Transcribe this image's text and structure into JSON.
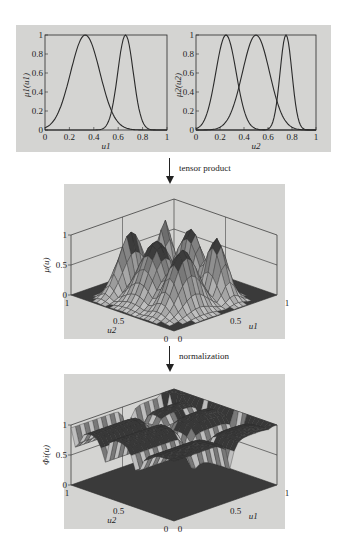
{
  "figure": {
    "top_panel": {
      "left_plot": {
        "ylabel": "μ1(u1)",
        "xlabel": "u1",
        "xticks": [
          "0",
          "0.2",
          "0.4",
          "0.6",
          "0.8",
          "1"
        ],
        "yticks": [
          "0",
          "0.2",
          "0.4",
          "0.6",
          "0.8",
          "1"
        ]
      },
      "right_plot": {
        "ylabel": "μ2(u2)",
        "xlabel": "u2",
        "xticks": [
          "0",
          "0.2",
          "0.4",
          "0.6",
          "0.8",
          "1"
        ],
        "yticks": [
          "0",
          "0.2",
          "0.4",
          "0.6",
          "0.8",
          "1"
        ]
      }
    },
    "step1": {
      "label": "tensor product",
      "icon": "down-arrow-icon"
    },
    "middle_panel": {
      "zlabel": "μ(u)",
      "zticks": [
        "0",
        "0.5",
        "1"
      ],
      "u2_label": "u2",
      "u1_label": "u1",
      "u2_ticks": [
        "1",
        "0.5",
        "0"
      ],
      "u1_ticks": [
        "0",
        "0.5",
        "1"
      ]
    },
    "step2": {
      "label": "normalization",
      "icon": "down-arrow-icon"
    },
    "bottom_panel": {
      "zlabel": "Φi(u)",
      "zticks": [
        "0",
        "0.5",
        "1"
      ],
      "u2_label": "u2",
      "u1_label": "u1",
      "u2_ticks": [
        "1",
        "0.5",
        "0"
      ],
      "u1_ticks": [
        "0",
        "0.5",
        "1"
      ]
    },
    "colors": {
      "panel_bg": "#d4d4d2",
      "line": "#2a2a2a",
      "surface_dark": "#3a3a3a",
      "surface_light": "#b8b8b8"
    }
  },
  "chart_data": [
    {
      "type": "line",
      "title": "",
      "xlabel": "u1",
      "ylabel": "μ1(u1)",
      "xlim": [
        0,
        1
      ],
      "ylim": [
        0,
        1
      ],
      "grid": false,
      "series": [
        {
          "name": "μ1,1",
          "shape": "bell",
          "center": 0.33,
          "x": [
            0,
            0.1,
            0.2,
            0.3,
            0.33,
            0.4,
            0.5,
            0.6,
            0.7,
            0.8,
            0.9
          ],
          "values": [
            0.05,
            0.3,
            0.68,
            0.98,
            1.0,
            0.93,
            0.55,
            0.2,
            0.05,
            0.01,
            0
          ]
        },
        {
          "name": "μ1,2",
          "shape": "bell",
          "center": 0.66,
          "x": [
            0.4,
            0.5,
            0.55,
            0.6,
            0.66,
            0.7,
            0.75,
            0.8,
            0.9
          ],
          "values": [
            0,
            0.1,
            0.35,
            0.75,
            1.0,
            0.85,
            0.45,
            0.15,
            0
          ]
        }
      ]
    },
    {
      "type": "line",
      "title": "",
      "xlabel": "u2",
      "ylabel": "μ2(u2)",
      "xlim": [
        0,
        1
      ],
      "ylim": [
        0,
        1
      ],
      "grid": false,
      "series": [
        {
          "name": "μ2,1",
          "shape": "bell",
          "center": 0.25,
          "x": [
            0,
            0.1,
            0.2,
            0.25,
            0.3,
            0.4,
            0.5,
            0.58
          ],
          "values": [
            0.05,
            0.4,
            0.9,
            1.0,
            0.9,
            0.45,
            0.1,
            0
          ]
        },
        {
          "name": "μ2,2",
          "shape": "bell",
          "center": 0.5,
          "x": [
            0,
            0.1,
            0.2,
            0.3,
            0.4,
            0.5,
            0.6,
            0.7,
            0.8,
            0.9
          ],
          "values": [
            0,
            0.02,
            0.15,
            0.45,
            0.85,
            1.0,
            0.8,
            0.4,
            0.1,
            0
          ]
        },
        {
          "name": "μ2,3",
          "shape": "bell",
          "center": 0.75,
          "x": [
            0.55,
            0.6,
            0.65,
            0.7,
            0.75,
            0.8,
            0.85,
            0.9
          ],
          "values": [
            0,
            0.05,
            0.25,
            0.65,
            1.0,
            0.7,
            0.25,
            0
          ]
        }
      ]
    },
    {
      "type": "surface",
      "title": "tensor product",
      "xlabel": "u1",
      "ylabel": "u2",
      "zlabel": "μ(u)",
      "xlim": [
        0,
        1
      ],
      "ylim": [
        0,
        1
      ],
      "zlim": [
        0,
        1
      ],
      "description": "6 bell-shaped peaks (2×3 tensor product of memberships), each height 1",
      "peaks": [
        [
          0.33,
          0.25
        ],
        [
          0.33,
          0.5
        ],
        [
          0.33,
          0.75
        ],
        [
          0.66,
          0.25
        ],
        [
          0.66,
          0.5
        ],
        [
          0.66,
          0.75
        ]
      ]
    },
    {
      "type": "surface",
      "title": "normalization",
      "xlabel": "u1",
      "ylabel": "u2",
      "zlabel": "Φi(u)",
      "xlim": [
        0,
        1
      ],
      "ylim": [
        0,
        1
      ],
      "zlim": [
        0,
        1
      ],
      "description": "Normalized basis functions with plateau regions at height 1 (sum to one)"
    }
  ]
}
